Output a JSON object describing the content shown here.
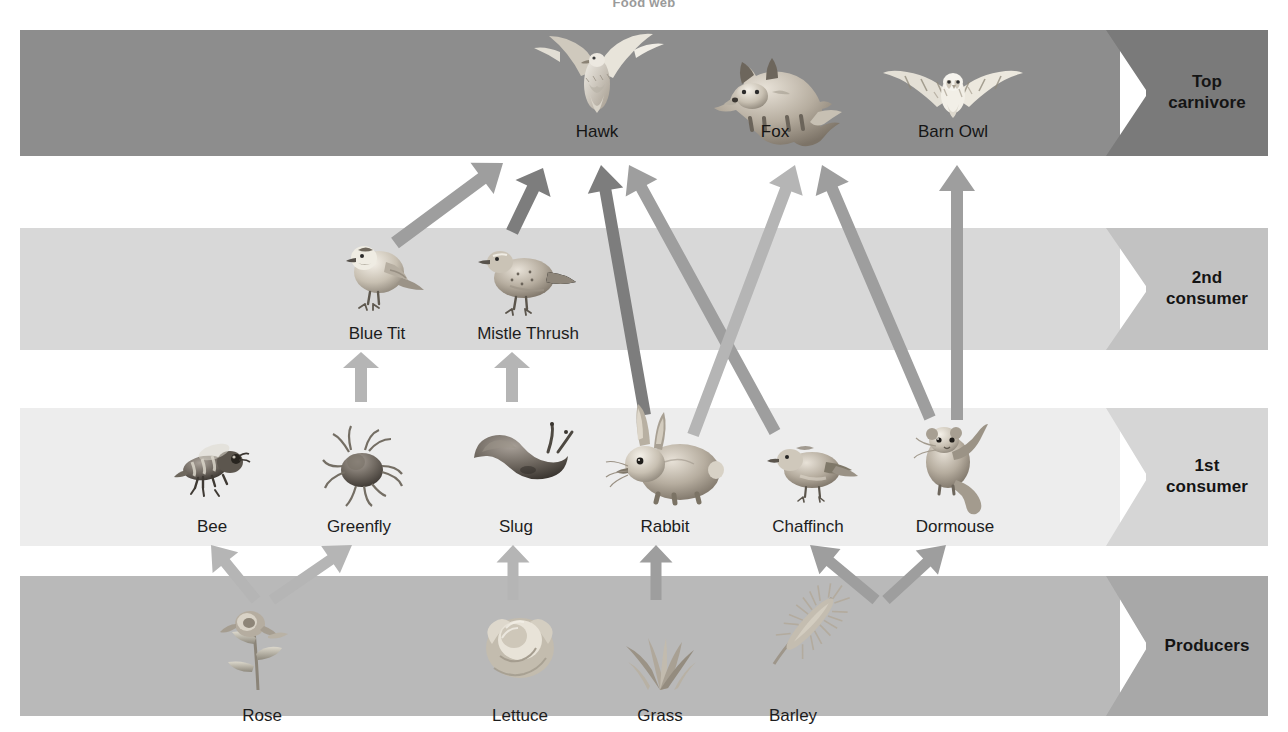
{
  "title": "Food web",
  "colors": {
    "band_top_body": "#8d8d8d",
    "band_top_cap": "#7a7a7a",
    "band_second_body": "#d8d8d8",
    "band_second_cap": "#c2c2c2",
    "band_first_body": "#ededed",
    "band_first_cap": "#d6d6d6",
    "band_producer_body": "#b9b9b9",
    "band_producer_cap": "#a8a8a8",
    "arrow_light": "#b5b5b5",
    "arrow_mid": "#9e9e9e",
    "arrow_dark": "#7d7d7d",
    "label_text": "#1d1d1d",
    "title_text": "#9a9a9a",
    "page_background": "#ffffff"
  },
  "bands": [
    {
      "id": "top-carnivore",
      "label": "Top carnivore",
      "label_lines": [
        "Top",
        "carnivore"
      ],
      "top": 30,
      "height": 126
    },
    {
      "id": "second-consumer",
      "label": "2nd consumer",
      "label_lines": [
        "2nd",
        "consumer"
      ],
      "top": 228,
      "height": 122
    },
    {
      "id": "first-consumer",
      "label": "1st consumer",
      "label_lines": [
        "1st",
        "consumer"
      ],
      "top": 408,
      "height": 138
    },
    {
      "id": "producers",
      "label": "Producers",
      "label_lines": [
        "Producers"
      ],
      "top": 576,
      "height": 140
    }
  ],
  "organisms": {
    "top_carnivore": [
      {
        "id": "hawk",
        "name": "Hawk",
        "x": 597,
        "label_y": 123,
        "art_y": 45
      },
      {
        "id": "fox",
        "name": "Fox",
        "x": 775,
        "label_y": 123,
        "art_y": 45
      },
      {
        "id": "barn-owl",
        "name": "Barn Owl",
        "x": 953,
        "label_y": 123,
        "art_y": 45
      }
    ],
    "second_consumer": [
      {
        "id": "blue-tit",
        "name": "Blue Tit",
        "x": 377,
        "label_y": 325,
        "art_y": 240
      },
      {
        "id": "mistle-thrush",
        "name": "Mistle Thrush",
        "x": 528,
        "label_y": 325,
        "art_y": 238
      }
    ],
    "first_consumer": [
      {
        "id": "bee",
        "name": "Bee",
        "x": 212,
        "label_y": 518,
        "art_y": 432
      },
      {
        "id": "greenfly",
        "name": "Greenfly",
        "x": 359,
        "label_y": 518,
        "art_y": 428
      },
      {
        "id": "slug",
        "name": "Slug",
        "x": 516,
        "label_y": 518,
        "art_y": 430
      },
      {
        "id": "rabbit",
        "name": "Rabbit",
        "x": 665,
        "label_y": 518,
        "art_y": 418
      },
      {
        "id": "chaffinch",
        "name": "Chaffinch",
        "x": 808,
        "label_y": 518,
        "art_y": 428
      },
      {
        "id": "dormouse",
        "name": "Dormouse",
        "x": 955,
        "label_y": 518,
        "art_y": 418
      }
    ],
    "producers": [
      {
        "id": "rose",
        "name": "Rose",
        "x": 262,
        "label_y": 707,
        "art_y": 608
      },
      {
        "id": "lettuce",
        "name": "Lettuce",
        "x": 520,
        "label_y": 707,
        "art_y": 606
      },
      {
        "id": "grass",
        "name": "Grass",
        "x": 660,
        "label_y": 707,
        "art_y": 608
      },
      {
        "id": "barley",
        "name": "Barley",
        "x": 793,
        "label_y": 707,
        "art_y": 600
      }
    ]
  },
  "chart_data": {
    "type": "diagram",
    "title": "Food web",
    "levels": [
      "Producers",
      "1st consumer",
      "2nd consumer",
      "Top carnivore"
    ],
    "nodes": [
      {
        "name": "Rose",
        "level": "Producers"
      },
      {
        "name": "Lettuce",
        "level": "Producers"
      },
      {
        "name": "Grass",
        "level": "Producers"
      },
      {
        "name": "Barley",
        "level": "Producers"
      },
      {
        "name": "Bee",
        "level": "1st consumer"
      },
      {
        "name": "Greenfly",
        "level": "1st consumer"
      },
      {
        "name": "Slug",
        "level": "1st consumer"
      },
      {
        "name": "Rabbit",
        "level": "1st consumer"
      },
      {
        "name": "Chaffinch",
        "level": "1st consumer"
      },
      {
        "name": "Dormouse",
        "level": "1st consumer"
      },
      {
        "name": "Blue Tit",
        "level": "2nd consumer"
      },
      {
        "name": "Mistle Thrush",
        "level": "2nd consumer"
      },
      {
        "name": "Hawk",
        "level": "Top carnivore"
      },
      {
        "name": "Fox",
        "level": "Top carnivore"
      },
      {
        "name": "Barn Owl",
        "level": "Top carnivore"
      }
    ],
    "edges": [
      {
        "from": "Rose",
        "to": "Bee"
      },
      {
        "from": "Rose",
        "to": "Greenfly"
      },
      {
        "from": "Lettuce",
        "to": "Slug"
      },
      {
        "from": "Grass",
        "to": "Rabbit"
      },
      {
        "from": "Barley",
        "to": "Chaffinch"
      },
      {
        "from": "Barley",
        "to": "Dormouse"
      },
      {
        "from": "Greenfly",
        "to": "Blue Tit"
      },
      {
        "from": "Slug",
        "to": "Mistle Thrush"
      },
      {
        "from": "Blue Tit",
        "to": "Hawk"
      },
      {
        "from": "Mistle Thrush",
        "to": "Hawk"
      },
      {
        "from": "Rabbit",
        "to": "Hawk"
      },
      {
        "from": "Chaffinch",
        "to": "Hawk"
      },
      {
        "from": "Rabbit",
        "to": "Fox"
      },
      {
        "from": "Dormouse",
        "to": "Fox"
      },
      {
        "from": "Dormouse",
        "to": "Barn Owl"
      }
    ]
  },
  "arrows": [
    {
      "id": "rose-to-bee",
      "from": "Rose",
      "to": "Bee",
      "x1": 256,
      "y1": 600,
      "x2": 211,
      "y2": 545,
      "tone": "arrow_light",
      "width": 11
    },
    {
      "id": "rose-to-greenfly",
      "from": "Rose",
      "to": "Greenfly",
      "x1": 272,
      "y1": 600,
      "x2": 352,
      "y2": 545,
      "tone": "arrow_light",
      "width": 11
    },
    {
      "id": "lettuce-to-slug",
      "from": "Lettuce",
      "to": "Slug",
      "x1": 513,
      "y1": 600,
      "x2": 513,
      "y2": 545,
      "tone": "arrow_light",
      "width": 11
    },
    {
      "id": "grass-to-rabbit",
      "from": "Grass",
      "to": "Rabbit",
      "x1": 656,
      "y1": 600,
      "x2": 656,
      "y2": 545,
      "tone": "arrow_mid",
      "width": 11
    },
    {
      "id": "barley-to-chaffinch",
      "from": "Barley",
      "to": "Chaffinch",
      "x1": 876,
      "y1": 600,
      "x2": 810,
      "y2": 545,
      "tone": "arrow_mid",
      "width": 11
    },
    {
      "id": "barley-to-dormouse",
      "from": "Barley",
      "to": "Dormouse",
      "x1": 886,
      "y1": 600,
      "x2": 946,
      "y2": 545,
      "tone": "arrow_mid",
      "width": 11
    },
    {
      "id": "greenfly-to-blue-tit",
      "from": "Greenfly",
      "to": "Blue Tit",
      "x1": 361,
      "y1": 402,
      "x2": 361,
      "y2": 352,
      "tone": "arrow_light",
      "width": 12
    },
    {
      "id": "slug-to-mistle-thrush",
      "from": "Slug",
      "to": "Mistle Thrush",
      "x1": 512,
      "y1": 402,
      "x2": 512,
      "y2": 352,
      "tone": "arrow_light",
      "width": 12
    },
    {
      "id": "blue-tit-to-hawk",
      "from": "Blue Tit",
      "to": "Hawk",
      "x1": 395,
      "y1": 243,
      "x2": 503,
      "y2": 163,
      "tone": "arrow_mid",
      "width": 13
    },
    {
      "id": "mistle-thrush-to-hawk",
      "from": "Mistle Thrush",
      "to": "Hawk",
      "x1": 512,
      "y1": 232,
      "x2": 543,
      "y2": 168,
      "tone": "arrow_dark",
      "width": 13
    },
    {
      "id": "rabbit-to-hawk",
      "from": "Rabbit",
      "to": "Hawk",
      "x1": 645,
      "y1": 415,
      "x2": 601,
      "y2": 165,
      "tone": "arrow_dark",
      "width": 12
    },
    {
      "id": "chaffinch-to-hawk",
      "from": "Chaffinch",
      "to": "Hawk",
      "x1": 775,
      "y1": 432,
      "x2": 629,
      "y2": 165,
      "tone": "arrow_mid",
      "width": 12
    },
    {
      "id": "rabbit-to-fox",
      "from": "Rabbit",
      "to": "Fox",
      "x1": 693,
      "y1": 435,
      "x2": 795,
      "y2": 165,
      "tone": "arrow_light",
      "width": 12
    },
    {
      "id": "dormouse-to-fox",
      "from": "Dormouse",
      "to": "Fox",
      "x1": 930,
      "y1": 418,
      "x2": 822,
      "y2": 165,
      "tone": "arrow_mid",
      "width": 12
    },
    {
      "id": "dormouse-to-barn-owl",
      "from": "Dormouse",
      "to": "Barn Owl",
      "x1": 957,
      "y1": 420,
      "x2": 957,
      "y2": 165,
      "tone": "arrow_mid",
      "width": 12
    }
  ]
}
